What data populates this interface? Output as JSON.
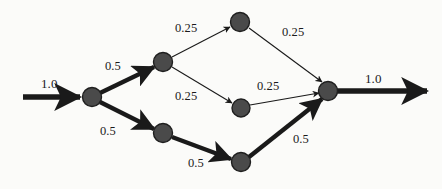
{
  "figure": {
    "type": "flow-network-diagram",
    "background_color": "#fbfbf9",
    "node_fill": "#4a4a4a",
    "node_stroke": "#1f1f1f",
    "edge_color": "#1a1a1a",
    "text_color": "#1a1a1a"
  },
  "nodes": [
    {
      "id": "n0",
      "x": 92,
      "y": 97,
      "r": 9.5,
      "name": "source-node"
    },
    {
      "id": "n1",
      "x": 163,
      "y": 62,
      "r": 9.5,
      "name": "upper-branch-node"
    },
    {
      "id": "n2",
      "x": 163,
      "y": 133,
      "r": 9.5,
      "name": "lower-branch-node"
    },
    {
      "id": "n3",
      "x": 240,
      "y": 22,
      "r": 9.5,
      "name": "top-node"
    },
    {
      "id": "n4",
      "x": 241,
      "y": 108,
      "r": 9.0,
      "name": "middle-node"
    },
    {
      "id": "n5",
      "x": 241,
      "y": 162,
      "r": 9.5,
      "name": "bottom-node"
    },
    {
      "id": "n6",
      "x": 328,
      "y": 91,
      "r": 9.5,
      "name": "sink-node"
    }
  ],
  "edges": [
    {
      "id": "e-in",
      "from": "entry",
      "to": "n0",
      "weight": "1.0",
      "thick": true,
      "name": "edge-input"
    },
    {
      "id": "e-0-1",
      "from": "n0",
      "to": "n1",
      "weight": "0.5",
      "thick": true,
      "name": "edge-source-to-upper"
    },
    {
      "id": "e-0-2",
      "from": "n0",
      "to": "n2",
      "weight": "0.5",
      "thick": true,
      "name": "edge-source-to-lower"
    },
    {
      "id": "e-1-3",
      "from": "n1",
      "to": "n3",
      "weight": "0.25",
      "thick": false,
      "name": "edge-upper-to-top"
    },
    {
      "id": "e-1-4",
      "from": "n1",
      "to": "n4",
      "weight": "0.25",
      "thick": false,
      "name": "edge-upper-to-middle"
    },
    {
      "id": "e-3-6",
      "from": "n3",
      "to": "n6",
      "weight": "0.25",
      "thick": false,
      "name": "edge-top-to-sink"
    },
    {
      "id": "e-4-6",
      "from": "n4",
      "to": "n6",
      "weight": "0.25",
      "thick": false,
      "name": "edge-middle-to-sink"
    },
    {
      "id": "e-2-5",
      "from": "n2",
      "to": "n5",
      "weight": "0.5",
      "thick": true,
      "name": "edge-lower-to-bottom"
    },
    {
      "id": "e-5-6",
      "from": "n5",
      "to": "n6",
      "weight": "0.5",
      "thick": true,
      "name": "edge-bottom-to-sink"
    },
    {
      "id": "e-out",
      "from": "n6",
      "to": "exit",
      "weight": "1.0",
      "thick": true,
      "name": "edge-output"
    }
  ],
  "labels": {
    "input_weight": "1.0",
    "source_upper_weight": "0.5",
    "source_lower_weight": "0.5",
    "upper_top_weight": "0.25",
    "upper_middle_weight": "0.25",
    "top_sink_weight": "0.25",
    "middle_sink_weight": "0.25",
    "lower_bottom_weight": "0.5",
    "bottom_sink_weight": "0.5",
    "output_weight": "1.0"
  }
}
